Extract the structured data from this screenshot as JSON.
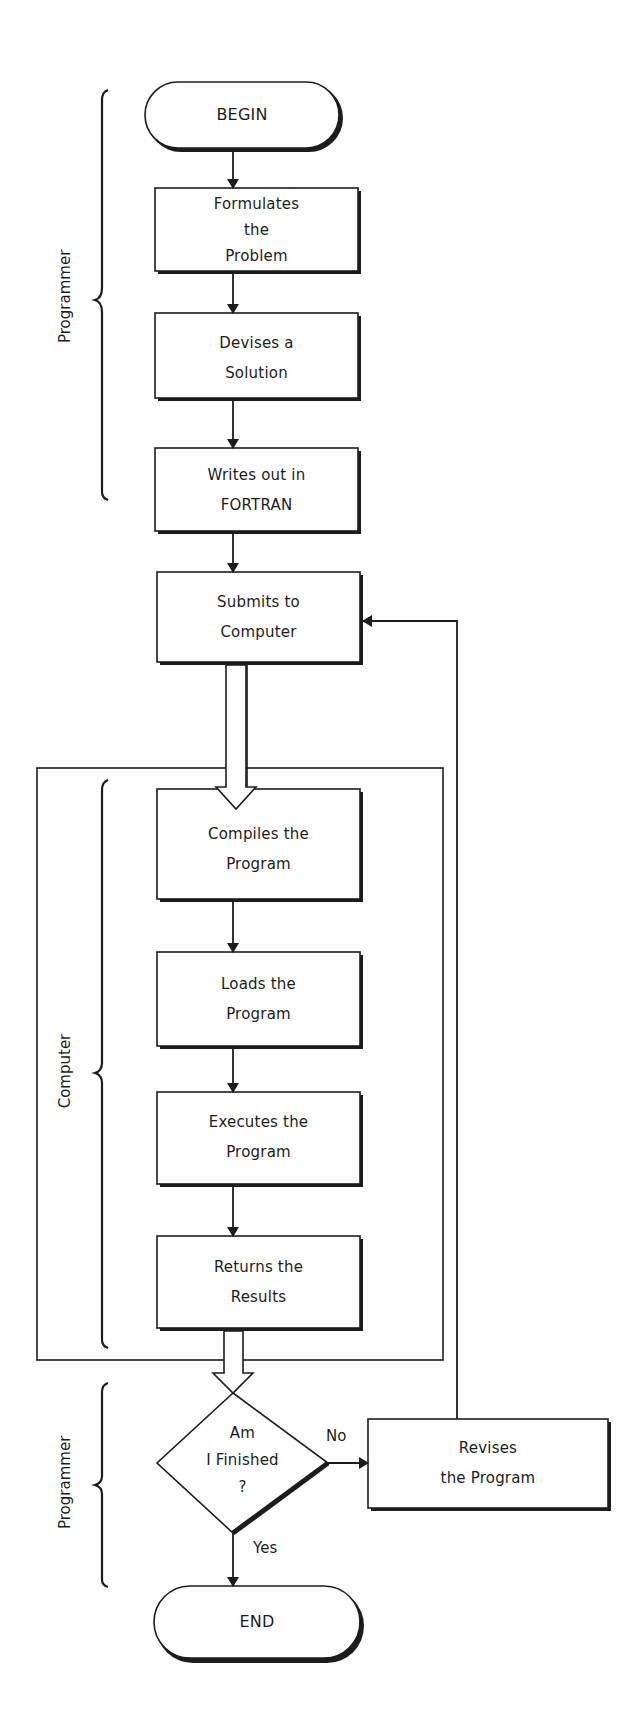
{
  "diagram": {
    "type": "flowchart",
    "colors": {
      "stroke": "#1c1c1c",
      "background": "#ffffff"
    },
    "nodes": {
      "begin": {
        "shape": "terminator",
        "lines": [
          "BEGIN"
        ]
      },
      "formulate": {
        "shape": "process",
        "lines": [
          "Formulates",
          "the",
          "Problem"
        ]
      },
      "devise": {
        "shape": "process",
        "lines": [
          "Devises a",
          "Solution"
        ]
      },
      "write": {
        "shape": "process",
        "lines": [
          "Writes out in",
          "FORTRAN"
        ]
      },
      "submit": {
        "shape": "process",
        "lines": [
          "Submits to",
          "Computer"
        ]
      },
      "compile": {
        "shape": "process",
        "lines": [
          "Compiles the",
          "Program"
        ]
      },
      "load": {
        "shape": "process",
        "lines": [
          "Loads the",
          "Program"
        ]
      },
      "execute": {
        "shape": "process",
        "lines": [
          "Executes the",
          "Program"
        ]
      },
      "return": {
        "shape": "process",
        "lines": [
          "Returns the",
          "Results"
        ]
      },
      "decision": {
        "shape": "decision",
        "lines": [
          "Am",
          "I Finished",
          "?"
        ]
      },
      "revise": {
        "shape": "process",
        "lines": [
          "Revises",
          "the Program"
        ]
      },
      "end": {
        "shape": "terminator",
        "lines": [
          "END"
        ]
      }
    },
    "edges": [
      {
        "from": "begin",
        "to": "formulate",
        "style": "arrow"
      },
      {
        "from": "formulate",
        "to": "devise",
        "style": "arrow"
      },
      {
        "from": "devise",
        "to": "write",
        "style": "arrow"
      },
      {
        "from": "write",
        "to": "submit",
        "style": "arrow"
      },
      {
        "from": "submit",
        "to": "compile",
        "style": "hollow-arrow"
      },
      {
        "from": "compile",
        "to": "load",
        "style": "arrow"
      },
      {
        "from": "load",
        "to": "execute",
        "style": "arrow"
      },
      {
        "from": "execute",
        "to": "return",
        "style": "arrow"
      },
      {
        "from": "return",
        "to": "decision",
        "style": "hollow-arrow"
      },
      {
        "from": "decision",
        "to": "revise",
        "style": "arrow",
        "label": "No"
      },
      {
        "from": "decision",
        "to": "end",
        "style": "arrow",
        "label": "Yes"
      },
      {
        "from": "revise",
        "to": "submit",
        "style": "arrow"
      }
    ],
    "groups": [
      {
        "id": "programmer-top",
        "label": "Programmer",
        "spans": [
          "begin",
          "formulate",
          "devise",
          "write"
        ]
      },
      {
        "id": "computer",
        "label": "Computer",
        "spans": [
          "compile",
          "load",
          "execute",
          "return"
        ],
        "boxed": true
      },
      {
        "id": "programmer-bottom",
        "label": "Programmer",
        "spans": [
          "decision"
        ]
      }
    ],
    "edge_labels": {
      "no": "No",
      "yes": "Yes"
    }
  }
}
